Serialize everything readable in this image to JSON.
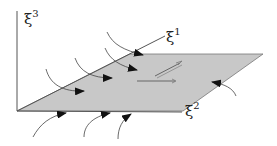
{
  "diagram": {
    "type": "coordinate-plane-with-flow",
    "axes": {
      "xi1": {
        "symbol": "ξ",
        "index": "1"
      },
      "xi2": {
        "symbol": "ξ",
        "index": "2"
      },
      "xi3": {
        "symbol": "ξ",
        "index": "3"
      }
    },
    "colors": {
      "plane_fill": "#c8c8c8",
      "line": "#444444",
      "background": "#ffffff"
    }
  }
}
